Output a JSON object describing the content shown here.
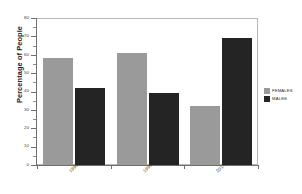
{
  "chart_data": {
    "type": "bar",
    "title": "",
    "xlabel": "",
    "ylabel": "Percentage of People",
    "categories": [
      "1998",
      "1996",
      "2014"
    ],
    "series": [
      {
        "name": "FEMALES",
        "color": "#9a9a9a",
        "values": [
          58,
          61,
          32
        ]
      },
      {
        "name": "MALES",
        "color": "#242424",
        "values": [
          42,
          39,
          69
        ]
      }
    ],
    "ylim": [
      0,
      80
    ],
    "yticks": [
      0,
      10,
      20,
      30,
      40,
      50,
      60,
      70,
      80
    ],
    "ytick_labels": [
      "0",
      "10",
      "20",
      "30",
      "40",
      "50",
      "60",
      "70",
      "80"
    ],
    "grid": false,
    "legend_position": "right"
  },
  "legend": {
    "entries": [
      {
        "label": "FEMALES",
        "swatch": "#9a9a9a"
      },
      {
        "label": "MALES",
        "swatch": "#242424"
      }
    ]
  },
  "axes": {
    "y_title": "Percentage of People"
  }
}
